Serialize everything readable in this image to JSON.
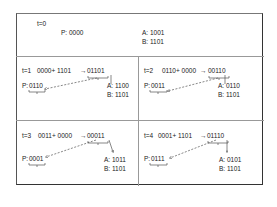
{
  "panel_t0": {
    "label": "t=0",
    "p": "P: 0000",
    "a": "A: 1001",
    "b": "B: 1101"
  },
  "panel_t1": {
    "label": "t=1",
    "equation": "0000+ 1101",
    "arrow": "→",
    "result": "01101",
    "p_prefix": "P:",
    "p_value": "0110",
    "a": "A: 1100",
    "b": "B: 1101"
  },
  "panel_t2": {
    "label": "t=2",
    "equation": "0110+ 0000",
    "arrow": "→",
    "result": "00110",
    "p_prefix": "P:",
    "p_value": "0011",
    "a": "A: 0110",
    "b": "B: 1101"
  },
  "panel_t3": {
    "label": "t=3",
    "equation": "0011+ 0000",
    "arrow": "→",
    "result": "00011",
    "p_prefix": "P:",
    "p_value": "0001",
    "a": "A: 1011",
    "b": "B: 1101"
  },
  "panel_t4": {
    "label": "t=4",
    "equation": "0001+ 1101",
    "arrow": "→",
    "result": "01110",
    "p_prefix": "P:",
    "p_value": "0111",
    "a": "A: 0101",
    "b": "B: 1101"
  }
}
